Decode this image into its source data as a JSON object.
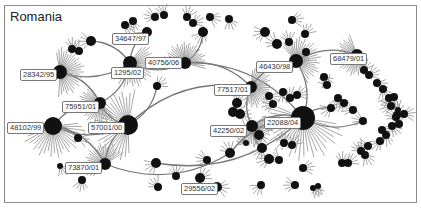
{
  "title": "Romania",
  "colors": {
    "node": "#111111",
    "edge": "#777777",
    "hair": "#8f8f8f",
    "border": "#8a8a8a"
  },
  "labels": [
    {
      "id": "34647/97",
      "x": 112,
      "y": 33
    },
    {
      "id": "28342/95",
      "x": 20,
      "y": 69
    },
    {
      "id": "1295/02",
      "x": 111,
      "y": 67
    },
    {
      "id": "40756/06",
      "x": 145,
      "y": 57
    },
    {
      "id": "46430/98",
      "x": 256,
      "y": 61
    },
    {
      "id": "68479/01",
      "x": 330,
      "y": 53
    },
    {
      "id": "77517/01",
      "x": 214,
      "y": 84
    },
    {
      "id": "75951/01",
      "x": 62,
      "y": 101
    },
    {
      "id": "48102/99",
      "x": 7,
      "y": 122
    },
    {
      "id": "57001/00",
      "x": 88,
      "y": 122
    },
    {
      "id": "42250/02",
      "x": 210,
      "y": 125
    },
    {
      "id": "22088/04",
      "x": 264,
      "y": 117
    },
    {
      "id": "73870/01",
      "x": 65,
      "y": 162
    },
    {
      "id": "29556/02",
      "x": 181,
      "y": 183
    }
  ],
  "nodes": [
    {
      "x": 60,
      "y": 72,
      "r": 7,
      "hub": true
    },
    {
      "x": 130,
      "y": 63,
      "r": 7,
      "hub": true
    },
    {
      "x": 53,
      "y": 126,
      "r": 9,
      "hub": true
    },
    {
      "x": 100,
      "y": 103,
      "r": 6,
      "hub": true
    },
    {
      "x": 128,
      "y": 125,
      "r": 10,
      "hub": true
    },
    {
      "x": 105,
      "y": 164,
      "r": 6,
      "hub": true
    },
    {
      "x": 185,
      "y": 63,
      "r": 6,
      "hub": true
    },
    {
      "x": 296,
      "y": 61,
      "r": 7,
      "hub": true
    },
    {
      "x": 251,
      "y": 87,
      "r": 6,
      "hub": true
    },
    {
      "x": 252,
      "y": 126,
      "r": 6,
      "hub": true
    },
    {
      "x": 303,
      "y": 118,
      "r": 12,
      "hub": true
    },
    {
      "x": 357,
      "y": 55,
      "r": 6,
      "hub": true
    },
    {
      "x": 155,
      "y": 17,
      "r": 4
    },
    {
      "x": 164,
      "y": 15,
      "r": 4
    },
    {
      "x": 187,
      "y": 17,
      "r": 4
    },
    {
      "x": 193,
      "y": 23,
      "r": 4
    },
    {
      "x": 210,
      "y": 17,
      "r": 4
    },
    {
      "x": 229,
      "y": 19,
      "r": 4
    },
    {
      "x": 203,
      "y": 32,
      "r": 5
    },
    {
      "x": 265,
      "y": 32,
      "r": 5
    },
    {
      "x": 277,
      "y": 44,
      "r": 5
    },
    {
      "x": 289,
      "y": 42,
      "r": 4
    },
    {
      "x": 305,
      "y": 34,
      "r": 4
    },
    {
      "x": 292,
      "y": 20,
      "r": 4
    },
    {
      "x": 125,
      "y": 25,
      "r": 4
    },
    {
      "x": 133,
      "y": 21,
      "r": 4
    },
    {
      "x": 147,
      "y": 32,
      "r": 5
    },
    {
      "x": 91,
      "y": 41,
      "r": 5
    },
    {
      "x": 79,
      "y": 51,
      "r": 4
    },
    {
      "x": 72,
      "y": 49,
      "r": 4
    },
    {
      "x": 157,
      "y": 86,
      "r": 4
    },
    {
      "x": 78,
      "y": 138,
      "r": 4
    },
    {
      "x": 60,
      "y": 166,
      "r": 3
    },
    {
      "x": 82,
      "y": 180,
      "r": 4
    },
    {
      "x": 156,
      "y": 163,
      "r": 5
    },
    {
      "x": 207,
      "y": 160,
      "r": 4
    },
    {
      "x": 230,
      "y": 153,
      "r": 5
    },
    {
      "x": 237,
      "y": 103,
      "r": 5
    },
    {
      "x": 233,
      "y": 112,
      "r": 5
    },
    {
      "x": 240,
      "y": 114,
      "r": 5
    },
    {
      "x": 259,
      "y": 135,
      "r": 5
    },
    {
      "x": 262,
      "y": 148,
      "r": 5
    },
    {
      "x": 269,
      "y": 159,
      "r": 5
    },
    {
      "x": 279,
      "y": 160,
      "r": 4
    },
    {
      "x": 284,
      "y": 143,
      "r": 4
    },
    {
      "x": 292,
      "y": 145,
      "r": 4
    },
    {
      "x": 303,
      "y": 168,
      "r": 4
    },
    {
      "x": 313,
      "y": 188,
      "r": 3
    },
    {
      "x": 318,
      "y": 186,
      "r": 3
    },
    {
      "x": 261,
      "y": 185,
      "r": 4
    },
    {
      "x": 295,
      "y": 185,
      "r": 4
    },
    {
      "x": 158,
      "y": 187,
      "r": 4
    },
    {
      "x": 176,
      "y": 176,
      "r": 4
    },
    {
      "x": 200,
      "y": 178,
      "r": 5
    },
    {
      "x": 217,
      "y": 187,
      "r": 5
    },
    {
      "x": 324,
      "y": 77,
      "r": 4
    },
    {
      "x": 338,
      "y": 98,
      "r": 4
    },
    {
      "x": 344,
      "y": 103,
      "r": 4
    },
    {
      "x": 353,
      "y": 110,
      "r": 4
    },
    {
      "x": 327,
      "y": 85,
      "r": 4
    },
    {
      "x": 364,
      "y": 70,
      "r": 4
    },
    {
      "x": 369,
      "y": 75,
      "r": 4
    },
    {
      "x": 377,
      "y": 83,
      "r": 4
    },
    {
      "x": 383,
      "y": 89,
      "r": 4
    },
    {
      "x": 389,
      "y": 98,
      "r": 4
    },
    {
      "x": 391,
      "y": 106,
      "r": 4
    },
    {
      "x": 396,
      "y": 117,
      "r": 4
    },
    {
      "x": 399,
      "y": 124,
      "r": 4
    },
    {
      "x": 397,
      "y": 115,
      "r": 4
    },
    {
      "x": 404,
      "y": 114,
      "r": 4
    },
    {
      "x": 392,
      "y": 126,
      "r": 4
    },
    {
      "x": 386,
      "y": 135,
      "r": 4
    },
    {
      "x": 380,
      "y": 141,
      "r": 4
    },
    {
      "x": 368,
      "y": 146,
      "r": 4
    },
    {
      "x": 361,
      "y": 151,
      "r": 4
    },
    {
      "x": 342,
      "y": 163,
      "r": 4
    },
    {
      "x": 348,
      "y": 163,
      "r": 4
    },
    {
      "x": 382,
      "y": 130,
      "r": 4
    },
    {
      "x": 365,
      "y": 155,
      "r": 4
    },
    {
      "x": 394,
      "y": 97,
      "r": 4
    },
    {
      "x": 331,
      "y": 108,
      "r": 4
    },
    {
      "x": 363,
      "y": 121,
      "r": 4
    },
    {
      "x": 398,
      "y": 110,
      "r": 3
    },
    {
      "x": 290,
      "y": 98,
      "r": 4
    },
    {
      "x": 297,
      "y": 95,
      "r": 4
    },
    {
      "x": 269,
      "y": 96,
      "r": 4
    },
    {
      "x": 283,
      "y": 92,
      "r": 4
    },
    {
      "x": 306,
      "y": 52,
      "r": 4
    },
    {
      "x": 273,
      "y": 104,
      "r": 4
    },
    {
      "x": 246,
      "y": 143,
      "r": 3
    }
  ],
  "edges": [
    [
      60,
      72,
      100,
      103
    ],
    [
      100,
      103,
      128,
      125
    ],
    [
      53,
      126,
      100,
      103
    ],
    [
      53,
      126,
      128,
      125
    ],
    [
      105,
      164,
      128,
      125
    ],
    [
      105,
      164,
      53,
      126
    ],
    [
      130,
      63,
      100,
      103
    ],
    [
      130,
      63,
      185,
      63
    ],
    [
      185,
      63,
      251,
      87
    ],
    [
      251,
      87,
      252,
      126
    ],
    [
      252,
      126,
      303,
      118
    ],
    [
      296,
      61,
      251,
      87
    ],
    [
      296,
      61,
      303,
      118
    ],
    [
      105,
      164,
      230,
      153
    ],
    [
      128,
      125,
      251,
      87
    ],
    [
      156,
      163,
      303,
      118
    ],
    [
      185,
      63,
      303,
      118
    ],
    [
      60,
      72,
      130,
      63
    ],
    [
      91,
      41,
      130,
      63
    ],
    [
      147,
      32,
      130,
      63
    ],
    [
      203,
      32,
      185,
      63
    ],
    [
      357,
      55,
      296,
      61
    ],
    [
      230,
      153,
      303,
      118
    ],
    [
      78,
      138,
      53,
      126
    ],
    [
      157,
      86,
      128,
      125
    ],
    [
      252,
      126,
      262,
      148
    ],
    [
      303,
      118,
      331,
      108
    ],
    [
      303,
      118,
      363,
      121
    ]
  ]
}
